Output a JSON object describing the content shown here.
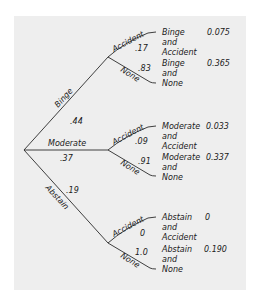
{
  "tree": {
    "root": {
      "branches": [
        {
          "label": "Binge",
          "prob": ".44",
          "children": [
            {
              "label": "Accident",
              "prob": ".17",
              "outcome": [
                "Binge",
                "and",
                "Accident"
              ],
              "joint": "0.075"
            },
            {
              "label": "None",
              "prob": ".83",
              "outcome": [
                "Binge",
                "and",
                "None"
              ],
              "joint": "0.365"
            }
          ]
        },
        {
          "label": "Moderate",
          "prob": ".37",
          "children": [
            {
              "label": "Accident",
              "prob": ".09",
              "outcome": [
                "Moderate",
                "and",
                "Accident"
              ],
              "joint": "0.033"
            },
            {
              "label": "None",
              "prob": ".91",
              "outcome": [
                "Moderate",
                "and",
                "None"
              ],
              "joint": "0.337"
            }
          ]
        },
        {
          "label": "Abstain",
          "prob": ".19",
          "children": [
            {
              "label": "Accident",
              "prob": "0",
              "outcome": [
                "Abstain",
                "and",
                "Accident"
              ],
              "joint": "0"
            },
            {
              "label": "None",
              "prob": "1.0",
              "outcome": [
                "Abstain",
                "and",
                "None"
              ],
              "joint": "0.190"
            }
          ]
        }
      ]
    }
  },
  "colors": {
    "panel_bg": "#eeeeee",
    "line": "#2a2a2a",
    "text": "#1a1a1a"
  }
}
